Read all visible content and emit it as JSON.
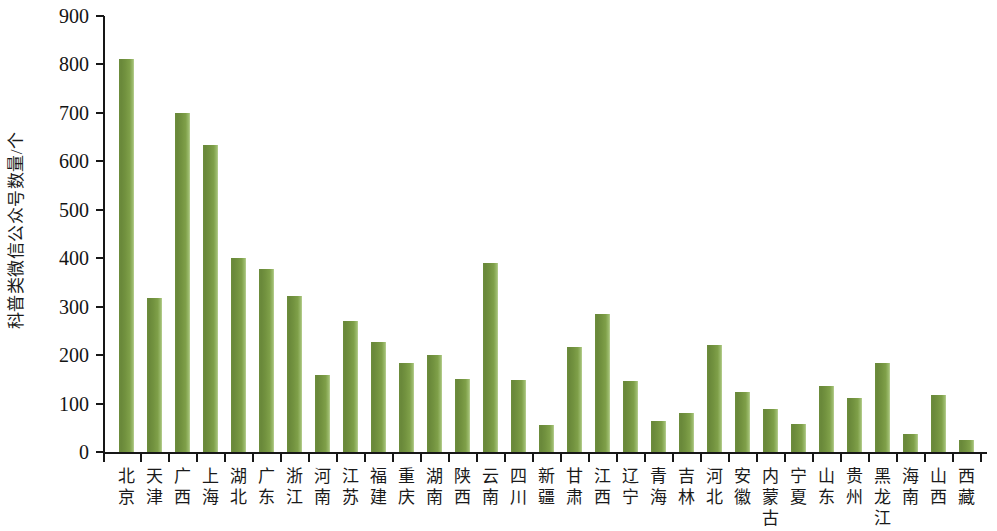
{
  "chart_data": {
    "type": "bar",
    "title": "",
    "xlabel": "",
    "ylabel": "科普类微信公众号数量/个",
    "ylim": [
      0,
      900
    ],
    "ytick_labels": [
      "900",
      "800",
      "700",
      "600",
      "500",
      "400",
      "300",
      "200",
      "100",
      "0"
    ],
    "ytick_values": [
      900,
      800,
      700,
      600,
      500,
      400,
      300,
      200,
      100,
      0
    ],
    "grid": false,
    "legend": null,
    "categories": [
      "北京",
      "天津",
      "广西",
      "上海",
      "湖北",
      "广东",
      "浙江",
      "河南",
      "江苏",
      "福建",
      "重庆",
      "湖南",
      "陕西",
      "云南",
      "四川",
      "新疆",
      "甘肃",
      "江西",
      "辽宁",
      "青海",
      "吉林",
      "河北",
      "安徽",
      "内蒙古",
      "宁夏",
      "山东",
      "贵州",
      "黑龙江",
      "海南",
      "山西",
      "西藏"
    ],
    "values": [
      812,
      317,
      699,
      633,
      400,
      378,
      323,
      159,
      271,
      228,
      184,
      200,
      150,
      390,
      149,
      56,
      217,
      284,
      146,
      64,
      81,
      220,
      124,
      88,
      57,
      136,
      112,
      183,
      37,
      118,
      25
    ],
    "series": [
      {
        "name": "科普类微信公众号数量",
        "color": "#6d8d3c",
        "values": [
          812,
          317,
          699,
          633,
          400,
          378,
          323,
          159,
          271,
          228,
          184,
          200,
          150,
          390,
          149,
          56,
          217,
          284,
          146,
          64,
          81,
          220,
          124,
          88,
          57,
          136,
          112,
          183,
          37,
          118,
          25
        ]
      }
    ],
    "bar_color": "#6d8d3c",
    "bar_highlight_color": "#b9d094",
    "axis_color": "#171717"
  }
}
